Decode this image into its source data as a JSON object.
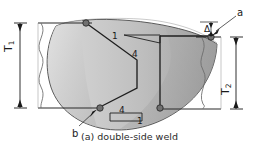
{
  "figure": {
    "caption": "(a) double-side weld",
    "labels": {
      "thickness_left": "T",
      "thickness_left_sub": "1",
      "thickness_right": "T",
      "thickness_right_sub": "2",
      "offset": "Δ",
      "callout_a": "a",
      "callout_b": "b",
      "slope_top_rise": "1",
      "slope_top_run": "4",
      "slope_bottom_run": "4",
      "slope_bottom_rise": "1"
    },
    "colors": {
      "weld_fill_light": "#cfcfcf",
      "weld_fill_mid": "#bdbdbd",
      "weld_fill_dark": "#a6a6a6",
      "outline": "#4a4a4a",
      "groove_line": "#1f1f1f",
      "node_marker": "#6e6e6e",
      "plate_line": "#2a2a2a",
      "text": "#1a1a1a",
      "background": "#ffffff"
    },
    "icons": {
      "node_top_left": "node-marker-icon",
      "node_bottom_left": "node-marker-icon",
      "node_top_right": "node-marker-icon",
      "node_bottom_right": "node-marker-icon",
      "arrow_a": "leader-arrow-icon",
      "arrow_b": "leader-arrow-icon",
      "break_line_left": "break-line-icon",
      "break_line_right": "break-line-icon"
    }
  }
}
